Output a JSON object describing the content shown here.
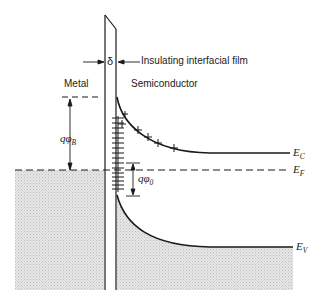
{
  "diagram": {
    "labels": {
      "delta": "δ",
      "insulating_film": "Insulating interfacial film",
      "metal": "Metal",
      "semiconductor": "Semiconductor",
      "barrier_height": "qφ",
      "barrier_height_sub": "B",
      "neutral_level": "qφ",
      "neutral_level_sub": "0",
      "conduction_band": "E",
      "conduction_band_sub": "C",
      "fermi_level": "E",
      "fermi_level_sub": "F",
      "valence_band": "E",
      "valence_band_sub": "V"
    },
    "colors": {
      "line": "#1a1a1a",
      "shading": "#d9d9d9",
      "background": "#ffffff"
    }
  }
}
